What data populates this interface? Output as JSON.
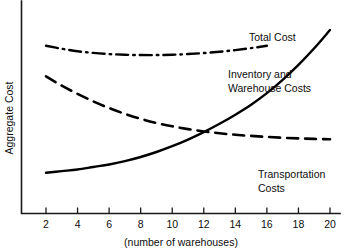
{
  "chart_data": {
    "type": "line",
    "title": "",
    "xlabel": "(number of warehouses)",
    "ylabel": "Aggregate Cost",
    "xlim": [
      1,
      20.6
    ],
    "ylim": [
      0,
      100
    ],
    "grid": false,
    "legend_position": "inline-annotations",
    "xticks": [
      2,
      4,
      6,
      8,
      10,
      12,
      14,
      16,
      18,
      20
    ],
    "xtick_labels": [
      "2",
      "4",
      "6",
      "8",
      "10",
      "12",
      "14",
      "16",
      "18",
      "20"
    ],
    "yticks": [],
    "ytick_labels": [],
    "x": [
      2,
      3,
      4,
      5,
      6,
      7,
      8,
      9,
      10,
      11,
      12,
      13,
      14,
      15,
      16,
      17,
      18,
      19,
      20
    ],
    "series": [
      {
        "name": "Inventory and Warehouse Costs",
        "style": "solid",
        "color": "#000000",
        "values": [
          14,
          15,
          16,
          17.5,
          19,
          21,
          23.5,
          26.5,
          30,
          34,
          38.5,
          43.5,
          49,
          55,
          62,
          70,
          79,
          89,
          100
        ]
      },
      {
        "name": "Transportation Costs",
        "style": "dashed",
        "color": "#000000",
        "values": [
          72,
          66.5,
          61.5,
          57,
          53,
          49.5,
          46.5,
          44,
          42,
          40.3,
          38.9,
          37.8,
          36.9,
          36.2,
          35.6,
          35.1,
          34.7,
          34.4,
          34.2
        ]
      },
      {
        "name": "Total Cost",
        "style": "dashdot",
        "color": "#000000",
        "values": [
          90.5,
          88.7,
          87.2,
          86.2,
          85.5,
          85.1,
          84.9,
          84.9,
          85.1,
          85.5,
          86.1,
          86.9,
          87.9,
          89.1,
          90.5,
          92,
          93.3,
          94.2,
          94.6
        ],
        "x_end_index": 14
      }
    ],
    "annotations": [
      {
        "name": "total-cost",
        "text": "Total Cost",
        "lines": [
          "Total Cost"
        ],
        "x": 249,
        "y": 41
      },
      {
        "name": "inventory-warehouse",
        "text": "Inventory and Warehouse Costs",
        "lines": [
          "Inventory and",
          "Warehouse Costs"
        ],
        "x": 228,
        "y": 78
      },
      {
        "name": "transportation",
        "text": "Transportation Costs",
        "lines": [
          "Transportation",
          "Costs"
        ],
        "x": 258,
        "y": 178
      }
    ]
  }
}
